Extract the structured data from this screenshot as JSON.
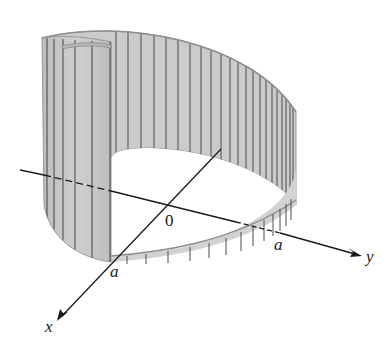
{
  "figure": {
    "colors": {
      "surface_fill": "#c9c9c9",
      "surface_light": "#dcdcdc",
      "rule_lines": "#555555",
      "axis": "#1a1a1a",
      "background": "#ffffff"
    }
  },
  "labels": {
    "origin": "0",
    "a_on_x_axis": "a",
    "a_on_y_axis": "a",
    "x_axis": "x",
    "y_axis": "y"
  }
}
